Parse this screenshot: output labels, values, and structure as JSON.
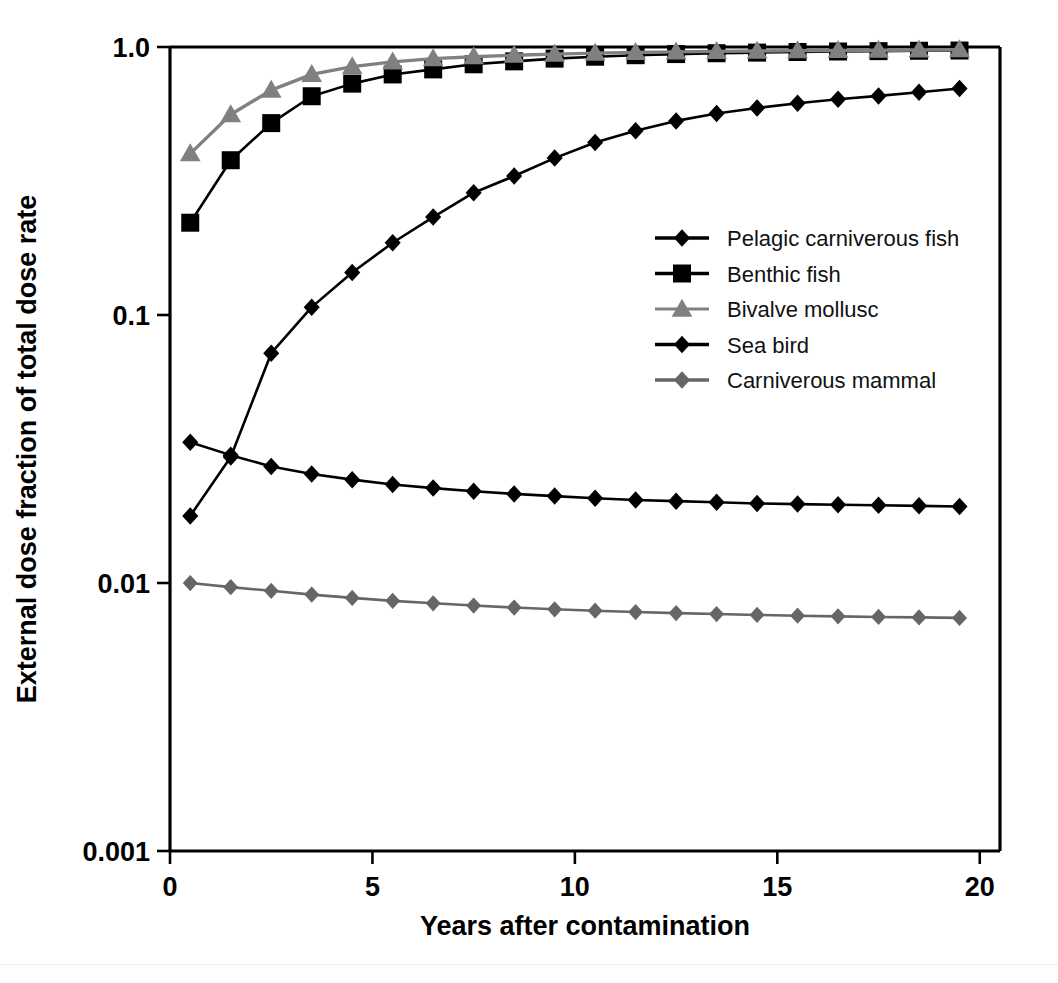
{
  "chart_data": {
    "type": "line",
    "title": "",
    "xlabel": "Years after contamination",
    "ylabel": "External dose fraction of total dose rate",
    "yscale": "log",
    "xlim": [
      0,
      20.5
    ],
    "ylim": [
      0.001,
      1.0
    ],
    "grid": false,
    "legend_position": "center-right",
    "xticks": [
      "0",
      "5",
      "10",
      "15",
      "20"
    ],
    "xtick_values": [
      0,
      5,
      10,
      15,
      20
    ],
    "yticks": [
      "1.0",
      "0.1",
      "0.01",
      "0.001"
    ],
    "ytick_values": [
      1.0,
      0.1,
      0.01,
      0.001
    ],
    "x": [
      0.5,
      1.5,
      2.5,
      3.5,
      4.5,
      5.5,
      6.5,
      7.5,
      8.5,
      9.5,
      10.5,
      11.5,
      12.5,
      13.5,
      14.5,
      15.5,
      16.5,
      17.5,
      18.5,
      19.5
    ],
    "series": [
      {
        "name": "Pelagic carniverous fish",
        "color": "#000000",
        "marker": "diamond",
        "values": [
          0.0178,
          0.0295,
          0.072,
          0.107,
          0.144,
          0.186,
          0.232,
          0.286,
          0.33,
          0.385,
          0.44,
          0.487,
          0.53,
          0.565,
          0.592,
          0.617,
          0.638,
          0.657,
          0.678,
          0.7
        ]
      },
      {
        "name": "Benthic fish",
        "color": "#000000",
        "marker": "square",
        "values": [
          0.221,
          0.378,
          0.52,
          0.655,
          0.73,
          0.79,
          0.825,
          0.862,
          0.884,
          0.905,
          0.92,
          0.932,
          0.941,
          0.948,
          0.953,
          0.958,
          0.962,
          0.965,
          0.968,
          0.97
        ]
      },
      {
        "name": "Bivalve mollusc",
        "color": "#808080",
        "marker": "triangle",
        "values": [
          0.4,
          0.56,
          0.69,
          0.79,
          0.845,
          0.88,
          0.905,
          0.92,
          0.932,
          0.941,
          0.949,
          0.955,
          0.959,
          0.963,
          0.966,
          0.969,
          0.971,
          0.973,
          0.975,
          0.977
        ]
      },
      {
        "name": "Sea bird",
        "color": "#000000",
        "marker": "diamond",
        "values": [
          0.0335,
          0.03,
          0.0272,
          0.0255,
          0.0243,
          0.0233,
          0.0226,
          0.022,
          0.0215,
          0.0211,
          0.0207,
          0.0204,
          0.0202,
          0.02,
          0.0198,
          0.0197,
          0.0196,
          0.0195,
          0.0194,
          0.0193
        ]
      },
      {
        "name": "Carniverous mammal",
        "color": "#666666",
        "marker": "diamond",
        "values": [
          0.01,
          0.00965,
          0.00935,
          0.00905,
          0.0088,
          0.00858,
          0.0084,
          0.00824,
          0.0081,
          0.00798,
          0.00788,
          0.00779,
          0.00772,
          0.00766,
          0.0076,
          0.00755,
          0.00751,
          0.00747,
          0.00744,
          0.00741
        ]
      }
    ]
  },
  "legend": {
    "items": [
      {
        "label": "Pelagic carniverous fish",
        "color": "#000000",
        "marker": "diamond"
      },
      {
        "label": "Benthic fish",
        "color": "#000000",
        "marker": "square"
      },
      {
        "label": "Bivalve mollusc",
        "color": "#808080",
        "marker": "triangle"
      },
      {
        "label": "Sea bird",
        "color": "#000000",
        "marker": "diamond"
      },
      {
        "label": "Carniverous mammal",
        "color": "#666666",
        "marker": "diamond"
      }
    ]
  }
}
